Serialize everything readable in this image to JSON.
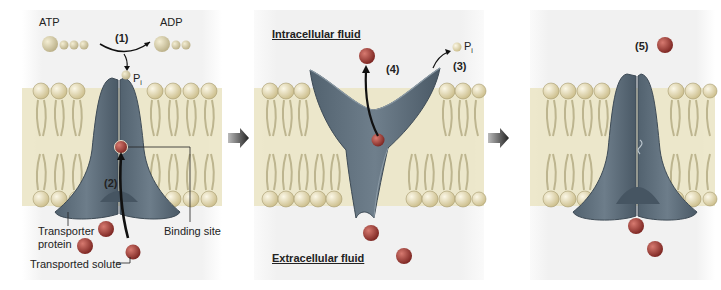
{
  "colors": {
    "membrane_band": "#ece6c8",
    "panel_bg": "#f3f3f3",
    "lipid_head": "#e8dcb0",
    "lipid_tail": "#c9c2a0",
    "transporter": "#5b6b78",
    "transporter_light": "#7d8c98",
    "solute": "#a23a35",
    "phosphate": "#cfc7a6",
    "arrow": "#111111",
    "step_arrow": "#444444"
  },
  "panels": [
    {
      "id": "panel-1",
      "labels": {
        "atp": "ATP",
        "adp": "ADP",
        "step1": "(1)",
        "pi": "P",
        "pi_sub": "i",
        "step2": "(2)",
        "binding_site": "Binding site",
        "transporter_line1": "Transporter",
        "transporter_line2": "protein",
        "transported_solute": "Transported solute"
      }
    },
    {
      "id": "panel-2",
      "labels": {
        "intracellular": "Intracellular fluid",
        "extracellular": "Extracellular fluid",
        "step3": "(3)",
        "step4": "(4)",
        "pi": "P",
        "pi_sub": "i"
      }
    },
    {
      "id": "panel-3",
      "labels": {
        "step5": "(5)"
      }
    }
  ],
  "transitions": [
    {
      "from": "panel-1",
      "to": "panel-2",
      "icon": "right-arrow-icon"
    },
    {
      "from": "panel-2",
      "to": "panel-3",
      "icon": "right-arrow-icon"
    }
  ]
}
